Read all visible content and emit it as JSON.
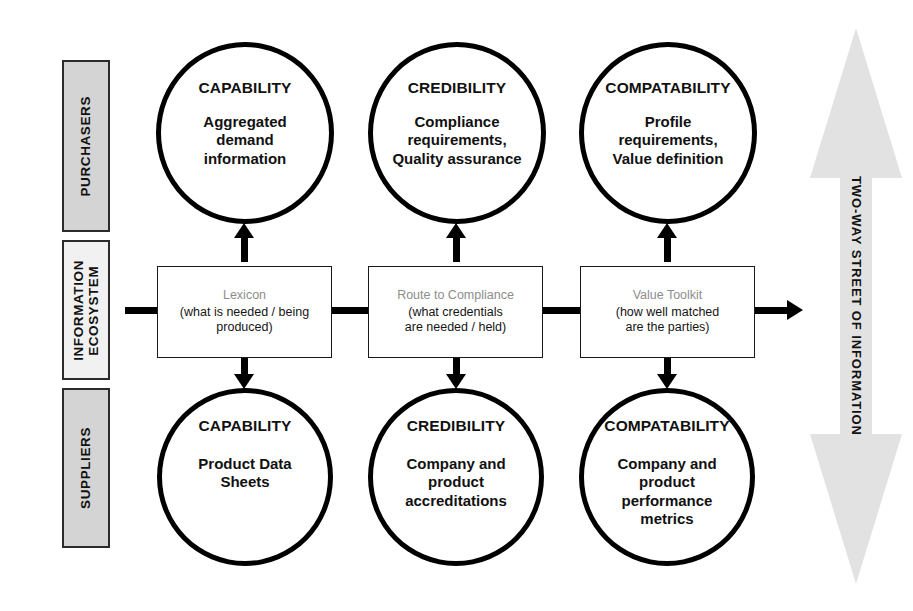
{
  "bands": [
    {
      "id": "purchasers",
      "label": "PURCHASERS"
    },
    {
      "id": "ecosystem",
      "label": "INFORMATION\nECOSYSTEM"
    },
    {
      "id": "suppliers",
      "label": "SUPPLIERS"
    }
  ],
  "top_circles": [
    {
      "heading": "CAPABILITY",
      "body": "Aggregated\ndemand\ninformation"
    },
    {
      "heading": "CREDIBILITY",
      "body": "Compliance\nrequirements,\nQuality assurance"
    },
    {
      "heading": "COMPATABILITY",
      "body": "Profile\nrequirements,\nValue definition"
    }
  ],
  "bottom_circles": [
    {
      "heading": "CAPABILITY",
      "body": "Product Data\nSheets"
    },
    {
      "heading": "CREDIBILITY",
      "body": "Company and\nproduct\naccreditations"
    },
    {
      "heading": "COMPATABILITY",
      "body": "Company and\nproduct\nperformance\nmetrics"
    }
  ],
  "middle_boxes": [
    {
      "title": "Lexicon",
      "subtitle": "(what is needed / being\nproduced)"
    },
    {
      "title": "Route to Compliance",
      "subtitle": "(what credentials\nare needed / held)"
    },
    {
      "title": "Value Toolkit",
      "subtitle": "(how well matched\nare the parties)"
    }
  ],
  "two_way_arrow": {
    "label": "TWO-WAY STREET OF INFORMATION"
  },
  "colors": {
    "band_dark": "#d4d4d4",
    "band_light": "#f1f1f1",
    "stroke": "#000000",
    "box_title_gray": "#8d8d8d",
    "arrow_gray": "#e2e2e2"
  }
}
